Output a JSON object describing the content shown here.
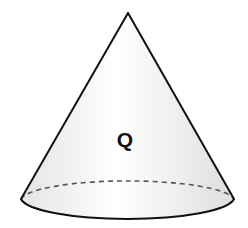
{
  "diagram": {
    "type": "cone",
    "label": "Q",
    "colors": {
      "outline": "#111111",
      "hidden_edge": "#555555",
      "fill_light": "#ffffff",
      "fill_shade": "#e6e6e6"
    },
    "geometry": {
      "apex": [
        128,
        13
      ],
      "base_center": [
        128,
        201
      ],
      "base_rx": 107,
      "base_ry": 21
    }
  }
}
